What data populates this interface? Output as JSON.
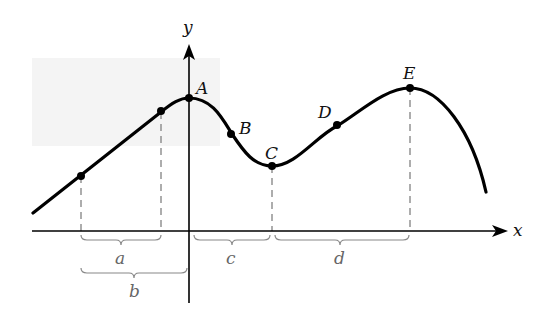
{
  "diagram": {
    "axes": {
      "x_label": "x",
      "y_label": "y"
    },
    "points": [
      {
        "name": "A",
        "label": "A"
      },
      {
        "name": "B",
        "label": "B"
      },
      {
        "name": "C",
        "label": "C"
      },
      {
        "name": "D",
        "label": "D"
      },
      {
        "name": "E",
        "label": "E"
      }
    ],
    "intervals": [
      {
        "name": "a",
        "label": "a"
      },
      {
        "name": "b",
        "label": "b"
      },
      {
        "name": "c",
        "label": "c"
      },
      {
        "name": "d",
        "label": "d"
      }
    ],
    "colors": {
      "curve": "#000000",
      "background_panel": "#f3f3f3",
      "brace": "#888888",
      "dash": "#777777"
    }
  }
}
